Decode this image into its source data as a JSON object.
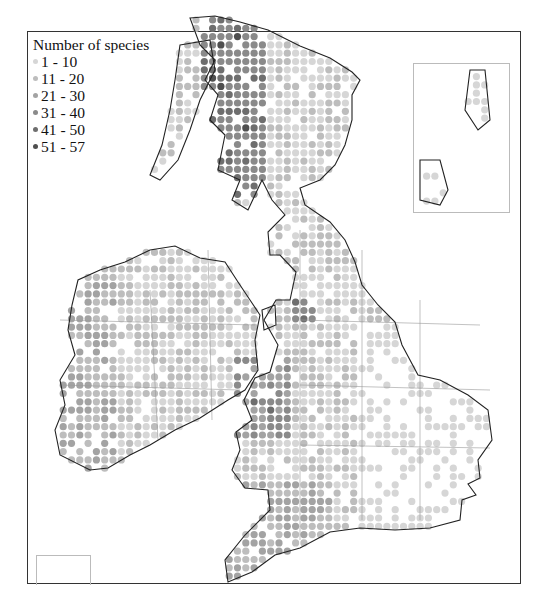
{
  "chart_data": {
    "type": "map",
    "title": "Number of species",
    "legend": [
      {
        "label": "1 - 10",
        "color": "#d6d6d6"
      },
      {
        "label": "11 - 20",
        "color": "#bdbdbd"
      },
      {
        "label": "21 - 30",
        "color": "#a3a3a3"
      },
      {
        "label": "31 - 40",
        "color": "#8a8a8a"
      },
      {
        "label": "41 - 50",
        "color": "#6e6e6e"
      },
      {
        "label": "51 - 57",
        "color": "#4f4f4f"
      }
    ],
    "regions": [
      {
        "name": "Scotland Highlands (west)",
        "dominant_class": "31 - 40",
        "max_class": "51 - 57"
      },
      {
        "name": "Scotland (east)",
        "dominant_class": "1 - 10"
      },
      {
        "name": "Southern Scotland",
        "dominant_class": "11 - 20"
      },
      {
        "name": "Lake District",
        "dominant_class": "31 - 40"
      },
      {
        "name": "North Wales / Snowdonia",
        "dominant_class": "41 - 50"
      },
      {
        "name": "Wales",
        "dominant_class": "21 - 30"
      },
      {
        "name": "Southwest England",
        "dominant_class": "21 - 30"
      },
      {
        "name": "East England",
        "dominant_class": "1 - 10",
        "coverage": "sparse"
      },
      {
        "name": "Western Ireland (Kerry, Connemara, Donegal)",
        "dominant_class": "21 - 30"
      },
      {
        "name": "Central Ireland",
        "dominant_class": "11 - 20"
      }
    ],
    "insets": [
      "Shetland & Orkney (top right)",
      "Channel Islands (bottom left)"
    ],
    "grid": true
  },
  "legend": {
    "title": "Number of species",
    "items": [
      "1 - 10",
      "11 - 20",
      "21 - 30",
      "31 - 40",
      "41 - 50",
      "51 - 57"
    ],
    "colors": [
      "#d6d6d6",
      "#bdbdbd",
      "#a3a3a3",
      "#8a8a8a",
      "#6e6e6e",
      "#4f4f4f"
    ]
  }
}
